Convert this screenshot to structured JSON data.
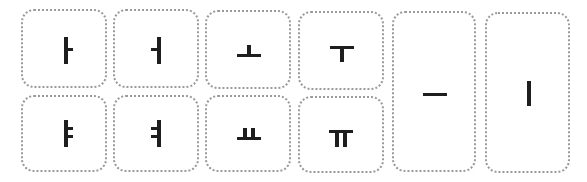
{
  "cards": [
    {
      "id": "a",
      "glyph": "ㅏ",
      "name": "vowel-a"
    },
    {
      "id": "eo",
      "glyph": "ㅓ",
      "name": "vowel-eo"
    },
    {
      "id": "o",
      "glyph": "ㅗ",
      "name": "vowel-o"
    },
    {
      "id": "u",
      "glyph": "ㅜ",
      "name": "vowel-u"
    },
    {
      "id": "eu",
      "glyph": "ㅡ",
      "name": "vowel-eu"
    },
    {
      "id": "i",
      "glyph": "ㅣ",
      "name": "vowel-i"
    },
    {
      "id": "ya",
      "glyph": "ㅑ",
      "name": "vowel-ya"
    },
    {
      "id": "yeo",
      "glyph": "ㅕ",
      "name": "vowel-yeo"
    },
    {
      "id": "yo",
      "glyph": "ㅛ",
      "name": "vowel-yo"
    },
    {
      "id": "yu",
      "glyph": "ㅠ",
      "name": "vowel-yu"
    }
  ],
  "colors": {
    "border": "#9a9a9a",
    "stroke": "#1e1e1e",
    "background": "#ffffff"
  }
}
